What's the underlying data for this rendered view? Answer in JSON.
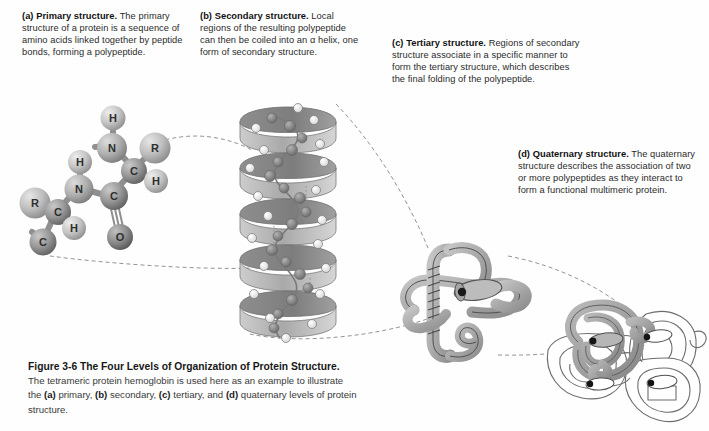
{
  "figure": {
    "number": "Figure 3-6",
    "title": "The Four Levels of Organization of Protein Structure.",
    "caption_rest": " The tetrameric protein hemoglobin is used here as an example to illustrate the ",
    "caption_a": "(a)",
    "caption_a_text": " primary, ",
    "caption_b": "(b)",
    "caption_b_text": " secondary, ",
    "caption_c": "(c)",
    "caption_c_text": " tertiary, and ",
    "caption_d": "(d)",
    "caption_d_text": " quaternary levels of protein structure."
  },
  "panels": [
    {
      "key": "a",
      "tag": "(a)",
      "heading": "Primary structure.",
      "text": "The primary structure of a protein is a sequence of amino acids linked together by peptide bonds, forming a polypeptide.",
      "illustration": "ball-and-stick-polypeptide-backbone"
    },
    {
      "key": "b",
      "tag": "(b)",
      "heading": "Secondary structure.",
      "text": "Local regions of the resulting polypeptide can then be coiled into an α helix, one form of secondary structure.",
      "illustration": "alpha-helix-ribbon"
    },
    {
      "key": "c",
      "tag": "(c)",
      "heading": "Tertiary structure.",
      "text": "Regions of secondary structure associate in a specific manner to form the tertiary structure, which describes the final folding of the polypeptide.",
      "illustration": "folded-globin-subunit"
    },
    {
      "key": "d",
      "tag": "(d)",
      "heading": "Quaternary structure.",
      "text": "The quaternary structure describes the association of two or more polypeptides as they interact to form a functional multimeric protein.",
      "illustration": "hemoglobin-tetramer"
    }
  ],
  "molecule_atoms": [
    {
      "label": "H",
      "kind": "hydrogen"
    },
    {
      "label": "N",
      "kind": "nitrogen"
    },
    {
      "label": "R",
      "kind": "side-chain"
    },
    {
      "label": "C",
      "kind": "carbon"
    },
    {
      "label": "H",
      "kind": "hydrogen"
    },
    {
      "label": "C",
      "kind": "carbon"
    },
    {
      "label": "O",
      "kind": "oxygen"
    },
    {
      "label": "H",
      "kind": "hydrogen"
    },
    {
      "label": "N",
      "kind": "nitrogen"
    },
    {
      "label": "R",
      "kind": "side-chain"
    },
    {
      "label": "C",
      "kind": "carbon"
    },
    {
      "label": "H",
      "kind": "hydrogen"
    },
    {
      "label": "C",
      "kind": "carbon"
    }
  ],
  "colors": {
    "background": "#fefefe",
    "text": "#2b2b2b",
    "heading": "#111111",
    "atom_light": "#cfcfcf",
    "atom_mid": "#9a9a9a",
    "atom_dark": "#6f6f6f",
    "ribbon": "#b4b4b4",
    "ribbon_shadow": "#8d8d8d",
    "outline": "#4a4a4a",
    "dashed_connector": "#8a8a8a",
    "highlight_chain": "#9b9b9b"
  }
}
